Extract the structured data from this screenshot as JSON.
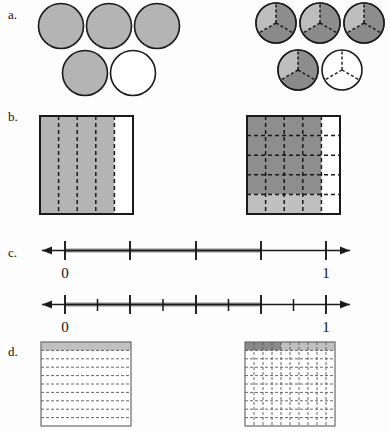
{
  "figure": {
    "background_color": "#fdfdfd",
    "stroke_color": "#1a1a1a",
    "shade_gray": "#b0b0b0",
    "shade_gray_dark": "#8f8f8f",
    "shade_gray_darker": "#787878",
    "shade_gray_light": "#c8c8c8",
    "white": "#ffffff"
  },
  "rows": [
    {
      "label": "a.",
      "label_x": 8,
      "label_y": 14,
      "kind": "circles",
      "left": {
        "name": "five-circles-four-shaded",
        "total": 5,
        "shaded": 4,
        "divisions": 1,
        "fraction": "4/5"
      },
      "right": {
        "name": "five-circles-each-in-thirds",
        "total": 5,
        "shaded": 4,
        "divisions": 3,
        "fraction": "12/15"
      }
    },
    {
      "label": "b.",
      "label_x": 8,
      "label_y": 117,
      "kind": "squares",
      "left": {
        "name": "square-five-columns-four-shaded",
        "columns": 5,
        "rows": 1,
        "shaded_columns": 4,
        "fraction": "4/5"
      },
      "right": {
        "name": "square-five-by-five-twenty-shaded",
        "columns": 5,
        "rows": 5,
        "shaded_columns": 4,
        "fraction": "20/25"
      }
    },
    {
      "label": "c.",
      "label_x": 8,
      "label_y": 254,
      "kind": "numberlines",
      "top": {
        "name": "number-line-fifths",
        "zero_label": "0",
        "one_label": "1",
        "ticks": 5,
        "bold_to": 4,
        "fraction": "4/5"
      },
      "bottom": {
        "name": "number-line-tenths",
        "zero_label": "0",
        "one_label": "1",
        "ticks": 10,
        "bold_to": 8,
        "fraction": "8/10"
      }
    },
    {
      "label": "d.",
      "label_x": 8,
      "label_y": 352,
      "kind": "grids",
      "left": {
        "name": "square-ten-rows-one-shaded",
        "columns": 1,
        "rows": 10,
        "shaded_rows": 1,
        "fraction": "1/10"
      },
      "right": {
        "name": "square-ten-by-ten-top-row-shaded",
        "columns": 10,
        "rows": 10,
        "shaded_cells": 10,
        "dark_cells": 4,
        "fraction": "10/100"
      }
    }
  ]
}
